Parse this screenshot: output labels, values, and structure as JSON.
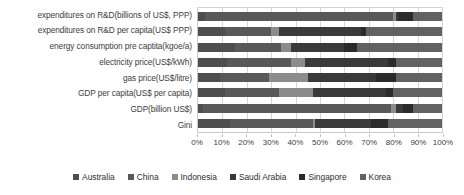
{
  "chart_data": {
    "type": "bar",
    "subtype": "stacked-bar-100-percent-horizontal",
    "title": "",
    "xlabel": "",
    "ylabel": "",
    "xlim": [
      0,
      100
    ],
    "ylim": null,
    "grid": true,
    "legend_position": "bottom",
    "unit": "%",
    "categories": [
      "expenditures on R&D(billions of US$, PPP)",
      "expenditures on R&D per capita(US$ PPP)",
      "energy consumption pre captita(kgoe/a)",
      "electricity price(US$/kWh)",
      "gas price(US$/litre)",
      "GDP per capita(US$ per capita)",
      "GDP(billion US$)",
      "Gini"
    ],
    "tick_labels": [
      "0%",
      "10%",
      "20%",
      "30%",
      "40%",
      "50%",
      "60%",
      "70%",
      "80%",
      "90%",
      "100%"
    ],
    "tick_values": [
      0,
      10,
      20,
      30,
      40,
      50,
      60,
      70,
      80,
      90,
      100
    ],
    "series": [
      {
        "name": "Australia",
        "color": "#4e4e4e",
        "values": [
          3,
          11,
          15,
          12,
          9,
          11,
          2,
          13
        ]
      },
      {
        "name": "China",
        "color": "#595959",
        "values": [
          77,
          19,
          19,
          26,
          20,
          22,
          77,
          34
        ]
      },
      {
        "name": "Indonesia",
        "color": "#8c8c8c",
        "values": [
          1,
          3,
          4,
          6,
          16,
          14,
          2,
          1
        ]
      },
      {
        "name": "Saudi Arabia",
        "color": "#3a3a3a",
        "values": [
          1,
          34,
          22,
          34,
          28,
          30,
          3,
          23
        ]
      },
      {
        "name": "Singapore",
        "color": "#2b2b2b",
        "values": [
          6,
          2,
          5,
          3,
          8,
          3,
          4,
          7
        ]
      },
      {
        "name": "Korea",
        "color": "#626262",
        "values": [
          12,
          31,
          35,
          19,
          19,
          20,
          12,
          22
        ]
      }
    ]
  }
}
